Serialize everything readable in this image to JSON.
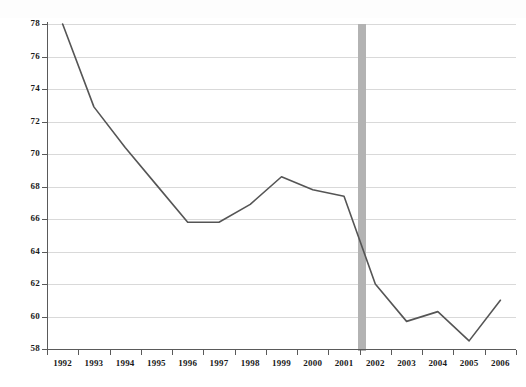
{
  "chart_data": {
    "type": "line",
    "title": "",
    "subtitle": "",
    "xlabel": "",
    "ylabel": "",
    "categories": [
      "1992",
      "1993",
      "1994",
      "1995",
      "1996",
      "1997",
      "1998",
      "1999",
      "2000",
      "2001",
      "2002",
      "2003",
      "2004",
      "2005",
      "2006"
    ],
    "x": [
      1992,
      1993,
      1994,
      1995,
      1996,
      1997,
      1998,
      1999,
      2000,
      2001,
      2002,
      2003,
      2004,
      2005,
      2006
    ],
    "values": [
      78.0,
      72.9,
      70.4,
      68.1,
      65.8,
      65.8,
      66.9,
      68.6,
      67.8,
      67.4,
      62.0,
      59.7,
      60.3,
      58.5,
      61.0
    ],
    "series": [
      {
        "name": "series-1",
        "color": "#555555",
        "values": [
          78.0,
          72.9,
          70.4,
          68.1,
          65.8,
          65.8,
          66.9,
          68.6,
          67.8,
          67.4,
          62.0,
          59.7,
          60.3,
          58.5,
          61.0
        ]
      }
    ],
    "ylim": [
      58,
      78
    ],
    "xlim": [
      1992,
      2006
    ],
    "ytick_labels": [
      "78",
      "76",
      "74",
      "72",
      "70",
      "68",
      "66",
      "64",
      "62",
      "60",
      "58"
    ],
    "ytick_values": [
      78,
      76,
      74,
      72,
      70,
      68,
      66,
      64,
      62,
      60,
      58
    ],
    "ytick_step": 2,
    "grid": true,
    "grid_color": "#d9d9d9",
    "axis_color": "#5a5a5a",
    "legend": false,
    "legend_position": "none",
    "annotations": [
      {
        "name": "recession-band",
        "type": "vertical-band",
        "label": "",
        "color": "#b3b3b3",
        "x_start": 2001.45,
        "x_end": 2001.7
      }
    ]
  }
}
